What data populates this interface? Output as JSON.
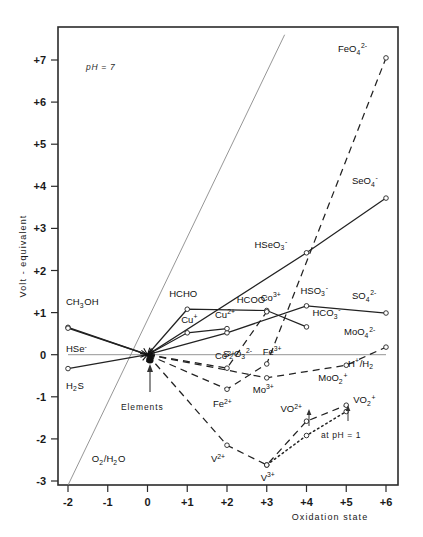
{
  "figure": {
    "annotation_ph": "pH = 7",
    "annotation_elements": "Elements",
    "annotation_at_ph1": "at pH = 1"
  },
  "chart_data": {
    "type": "line",
    "title": "",
    "xlabel": "Oxidation state",
    "ylabel": "Volt - equivalent",
    "xlim": [
      -2,
      6
    ],
    "ylim": [
      -3,
      7.6
    ],
    "grid": false,
    "legend": "none",
    "xticks": [
      "-2",
      "-1",
      "0",
      "+1",
      "+2",
      "+3",
      "+4",
      "+5",
      "+6"
    ],
    "xtick_values": [
      -2,
      -1,
      0,
      1,
      2,
      3,
      4,
      5,
      6
    ],
    "yticks": [
      "+7",
      "+6",
      "+5",
      "+4",
      "+3",
      "+2",
      "+1",
      "0",
      "-1",
      "-2",
      "-3"
    ],
    "ytick_values": [
      7,
      6,
      5,
      4,
      3,
      2,
      1,
      0,
      -1,
      -2,
      -3
    ],
    "series": [
      {
        "name": "Carbon",
        "style": "solid",
        "x": [
          -2,
          0,
          1,
          3,
          4
        ],
        "y": [
          0.65,
          0.0,
          1.08,
          1.05,
          0.66
        ],
        "labels": [
          {
            "text": "CH3OH",
            "x": -2,
            "y": 0.65,
            "dx": -2,
            "dy": -22,
            "anchor": "start",
            "html": "CH<sub>3</sub>OH"
          },
          {
            "text": "HCHO",
            "x": 1,
            "y": 1.08,
            "dx": -18,
            "dy": -12,
            "anchor": "start",
            "html": "HCHO"
          },
          {
            "text": "HCOO-",
            "x": 3,
            "y": 1.05,
            "dx": -30,
            "dy": -8,
            "anchor": "start",
            "html": "HCOO<sup>-</sup>"
          },
          {
            "text": "HCO3-",
            "x": 4,
            "y": 0.66,
            "dx": 6,
            "dy": -11,
            "anchor": "start",
            "html": "HCO<sub>3</sub><sup>-</sup>"
          }
        ]
      },
      {
        "name": "Sulfur",
        "style": "solid",
        "x": [
          -2,
          0,
          2,
          4,
          6
        ],
        "y": [
          -0.33,
          0.0,
          0.52,
          1.16,
          0.99
        ],
        "labels": [
          {
            "text": "H2S",
            "x": -2,
            "y": -0.33,
            "dx": -2,
            "dy": 20,
            "anchor": "start",
            "html": "H<sub>2</sub>S"
          },
          {
            "text": "S2O3 2-",
            "x": 2,
            "y": 0.52,
            "dx": -4,
            "dy": 24,
            "anchor": "start",
            "html": "S<sub>2</sub>O<sub>3</sub><sup>2-</sup>"
          },
          {
            "text": "HSO3-",
            "x": 4,
            "y": 1.16,
            "dx": -6,
            "dy": -12,
            "anchor": "start",
            "html": "HSO<sub>3</sub><sup>-</sup>"
          },
          {
            "text": "SO4 2-",
            "x": 6,
            "y": 0.99,
            "dx": -34,
            "dy": -14,
            "anchor": "start",
            "html": "SO<sub>4</sub><sup>2-</sup>"
          }
        ]
      },
      {
        "name": "Selenium",
        "style": "solid",
        "x": [
          -2,
          0,
          4,
          6
        ],
        "y": [
          0.63,
          0.0,
          2.42,
          3.72
        ],
        "labels": [
          {
            "text": "HSe-",
            "x": -2,
            "y": 0.63,
            "dx": -2,
            "dy": 24,
            "anchor": "start",
            "html": "HSe<sup>-</sup>"
          },
          {
            "text": "HSeO3-",
            "x": 4,
            "y": 2.42,
            "dx": -52,
            "dy": -5,
            "anchor": "start",
            "html": "HSeO<sub>3</sub><sup>-</sup>"
          },
          {
            "text": "SeO4-",
            "x": 6,
            "y": 3.72,
            "dx": -34,
            "dy": -14,
            "anchor": "start",
            "html": "SeO<sub>4</sub><sup>-</sup>"
          }
        ]
      },
      {
        "name": "Copper",
        "style": "solid",
        "x": [
          0,
          1,
          2
        ],
        "y": [
          0.0,
          0.52,
          0.62
        ],
        "labels": [
          {
            "text": "Cu+",
            "x": 1,
            "y": 0.52,
            "dx": -6,
            "dy": -10,
            "anchor": "start",
            "html": "Cu<sup>+</sup>"
          },
          {
            "text": "Cu2+",
            "x": 2,
            "y": 0.62,
            "dx": -12,
            "dy": -11,
            "anchor": "start",
            "html": "Cu<sup>2+</sup>"
          }
        ]
      },
      {
        "name": "Cobalt",
        "style": "dashed",
        "x": [
          0,
          2,
          3
        ],
        "y": [
          0.0,
          -0.32,
          1.02
        ],
        "labels": [
          {
            "text": "Co2+",
            "x": 2,
            "y": -0.32,
            "dx": -12,
            "dy": -9,
            "anchor": "start",
            "html": "Co<sup>2+</sup>"
          },
          {
            "text": "Co3+",
            "x": 3,
            "y": 1.02,
            "dx": -6,
            "dy": -11,
            "anchor": "start",
            "html": "Co<sup>3+</sup>"
          }
        ]
      },
      {
        "name": "Iron",
        "style": "dashed",
        "x": [
          0,
          2,
          3,
          6
        ],
        "y": [
          0.0,
          -0.82,
          -0.22,
          7.05
        ],
        "labels": [
          {
            "text": "Fe2+",
            "x": 2,
            "y": -0.82,
            "dx": -14,
            "dy": 18,
            "anchor": "start",
            "html": "Fe<sup>2+</sup>"
          },
          {
            "text": "Fe3+",
            "x": 3,
            "y": -0.22,
            "dx": -4,
            "dy": -9,
            "anchor": "start",
            "html": "Fe<sup>3+</sup>"
          },
          {
            "text": "FeO4 2-",
            "x": 6,
            "y": 7.05,
            "dx": -48,
            "dy": -6,
            "anchor": "start",
            "html": "FeO<sub>4</sub><sup>2-</sup>"
          }
        ]
      },
      {
        "name": "Molybdenum",
        "style": "dashed",
        "x": [
          0,
          3,
          5,
          6
        ],
        "y": [
          0.0,
          -0.55,
          -0.25,
          0.18
        ],
        "labels": [
          {
            "text": "Mo3+",
            "x": 3,
            "y": -0.55,
            "dx": -14,
            "dy": 15,
            "anchor": "start",
            "html": "Mo<sup>3+</sup>"
          },
          {
            "text": "MoO2+",
            "x": 5,
            "y": -0.25,
            "dx": -28,
            "dy": 16,
            "anchor": "start",
            "html": "MoO<sub>2</sub><sup>+</sup>"
          },
          {
            "text": "MoO4 2-",
            "x": 6,
            "y": 0.18,
            "dx": -42,
            "dy": -12,
            "anchor": "start",
            "html": "MoO<sub>4</sub><sup>2-</sup>"
          }
        ]
      },
      {
        "name": "Vanadium (pH 7)",
        "style": "dashed",
        "x": [
          0,
          2,
          3,
          4,
          5
        ],
        "y": [
          0.0,
          -2.15,
          -2.62,
          -1.58,
          -1.2
        ],
        "labels": [
          {
            "text": "V2+",
            "x": 2,
            "y": -2.15,
            "dx": -16,
            "dy": 17,
            "anchor": "start",
            "html": "V<sup>2+</sup>"
          },
          {
            "text": "V3+",
            "x": 3,
            "y": -2.62,
            "dx": -6,
            "dy": 16,
            "anchor": "start",
            "html": "V<sup>3+</sup>"
          },
          {
            "text": "VO2+",
            "x": 4,
            "y": -1.58,
            "dx": -26,
            "dy": -9,
            "anchor": "start",
            "html": "VO<sup>2+</sup>"
          },
          {
            "text": "VO2+ ion",
            "x": 5,
            "y": -1.2,
            "dx": 7,
            "dy": -2,
            "anchor": "start",
            "html": "VO<sub>2</sub><sup>+</sup>"
          }
        ]
      },
      {
        "name": "Vanadium (pH 1)",
        "style": "dotted",
        "x": [
          3,
          4,
          5
        ],
        "y": [
          -2.62,
          -1.92,
          -1.35
        ],
        "labels": []
      },
      {
        "name": "O2/H2O",
        "style": "thin-solid",
        "x": [
          -2,
          3.45
        ],
        "y": [
          -3.1,
          7.6
        ],
        "labels": [
          {
            "text": "O2/H2O",
            "x": -1.4,
            "y": -2.55,
            "dx": 0,
            "dy": 0,
            "anchor": "start",
            "html": "O<sub>2</sub>/H<sub>2</sub>O"
          }
        ]
      },
      {
        "name": "H+/H2",
        "style": "thin-solid",
        "x": [
          -2,
          6
        ],
        "y": [
          0.0,
          0.0
        ],
        "labels": [
          {
            "text": "H+/H2",
            "x": 6,
            "y": 0.0,
            "dx": -38,
            "dy": 12,
            "anchor": "start",
            "html": "H<sup>+</sup>/H<sub>2</sub>"
          }
        ]
      }
    ]
  }
}
